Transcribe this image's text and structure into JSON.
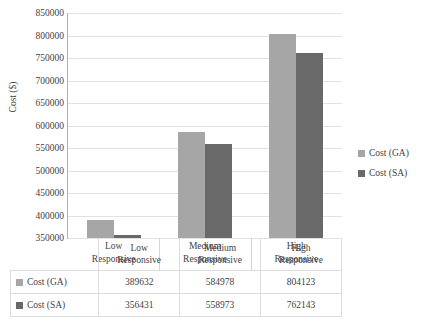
{
  "chart_data": {
    "type": "bar",
    "title": "",
    "xlabel": "",
    "ylabel": "Cost ($)",
    "categories": [
      "Low Responsive",
      "Medium Responsive",
      "High Responsive"
    ],
    "category_lines": [
      [
        "Low",
        "Responsive"
      ],
      [
        "Medium",
        "Responsive"
      ],
      [
        "High",
        "Responsive"
      ]
    ],
    "series": [
      {
        "name": "Cost (GA)",
        "color": "#a6a6a6",
        "values": [
          389632,
          584978,
          804123
        ]
      },
      {
        "name": "Cost (SA)",
        "color": "#696969",
        "values": [
          356431,
          558973,
          762143
        ]
      }
    ],
    "ylim": [
      350000,
      850000
    ],
    "ytick_labels": [
      "850000",
      "800000",
      "750000",
      "700000",
      "650000",
      "600000",
      "550000",
      "500000",
      "450000",
      "400000",
      "350000"
    ],
    "ytick_values": [
      850000,
      800000,
      750000,
      700000,
      650000,
      600000,
      550000,
      500000,
      450000,
      400000,
      350000
    ],
    "grid": true,
    "legend_position": "right",
    "data_table_visible": true
  },
  "legend": {
    "items": [
      {
        "label": "Cost (GA)",
        "color": "#a6a6a6"
      },
      {
        "label": "Cost (SA)",
        "color": "#696969"
      }
    ]
  },
  "table": {
    "header": [
      "",
      "Low Responsive",
      "Medium Responsive",
      "High Responsive"
    ],
    "rows": [
      {
        "series": "Cost (GA)",
        "color": "#a6a6a6",
        "values": [
          "389632",
          "584978",
          "804123"
        ]
      },
      {
        "series": "Cost (SA)",
        "color": "#696969",
        "values": [
          "356431",
          "558973",
          "762143"
        ]
      }
    ]
  }
}
